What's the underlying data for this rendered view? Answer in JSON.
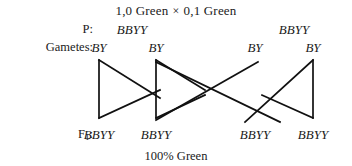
{
  "header": {
    "left_parent_phenotype": "1,0 Green",
    "operator": "×",
    "right_parent_phenotype": "0,1 Green"
  },
  "rows": {
    "parental": {
      "label": "P:",
      "genotypes": [
        "BBYY",
        "BBYY"
      ]
    },
    "gametes": {
      "label": "Gametes:",
      "values": [
        "BY",
        "BY",
        "BY",
        "BY"
      ]
    },
    "f1": {
      "label_prefix": "F",
      "label_subscript": "1",
      "label_suffix": ":",
      "genotypes": [
        "BBYY",
        "BBYY",
        "BBYY",
        "BBYY"
      ]
    }
  },
  "footer": {
    "result": "100% Green"
  },
  "colors": {
    "background": "#ffffff",
    "ink": "#1a1a1a",
    "line": "#111111"
  }
}
